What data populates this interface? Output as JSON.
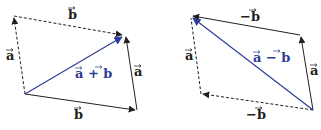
{
  "colors": {
    "vector_black": "#231f20",
    "vector_blue": "#2e3d96",
    "background": "#ffffff"
  },
  "diagrams": [
    {
      "name": "vector-addition",
      "corners": {
        "top_left": [
          14,
          16
        ],
        "top_right": [
          124,
          35
        ],
        "bottom_left": [
          25,
          94
        ],
        "bottom_right": [
          137,
          110
        ]
      },
      "labels": {
        "top_b": "b",
        "left_a": "a",
        "right_a": "a",
        "bottom_b": "b",
        "resultant": "a + b"
      }
    },
    {
      "name": "vector-subtraction",
      "corners": {
        "top_left": [
          191,
          16
        ],
        "top_right": [
          300,
          35
        ],
        "bottom_left": [
          201,
          94
        ],
        "bottom_right": [
          313,
          110
        ]
      },
      "labels": {
        "top_neg_b": "−b",
        "left_a": "a",
        "right_a": "a",
        "bottom_neg_b": "−b",
        "resultant": "a − b"
      }
    }
  ]
}
